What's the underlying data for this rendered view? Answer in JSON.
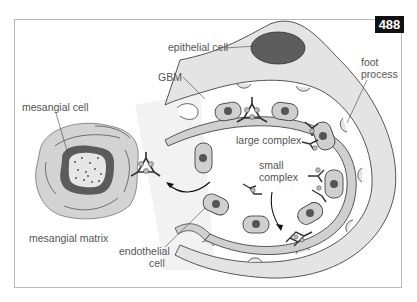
{
  "figure": {
    "number": "488",
    "labels": {
      "epithelial_cell": "epithelial cell",
      "gbm": "GBM",
      "foot_process": "foot",
      "foot_process_2": "process",
      "mesangial_cell": "mesangial cell",
      "large_complex": "large complex",
      "small_complex": "small",
      "small_complex_2": "complex",
      "mesangial_matrix": "mesangial matrix",
      "endothelial_cell": "endothelial",
      "endothelial_cell_2": "cell"
    },
    "colors": {
      "light_gray": "#e6e6e6",
      "mid_gray": "#cfcfcf",
      "dark_gray": "#5a5a5a",
      "nucleus": "#555555",
      "outline": "#333333",
      "badge_bg": "#111111"
    }
  }
}
